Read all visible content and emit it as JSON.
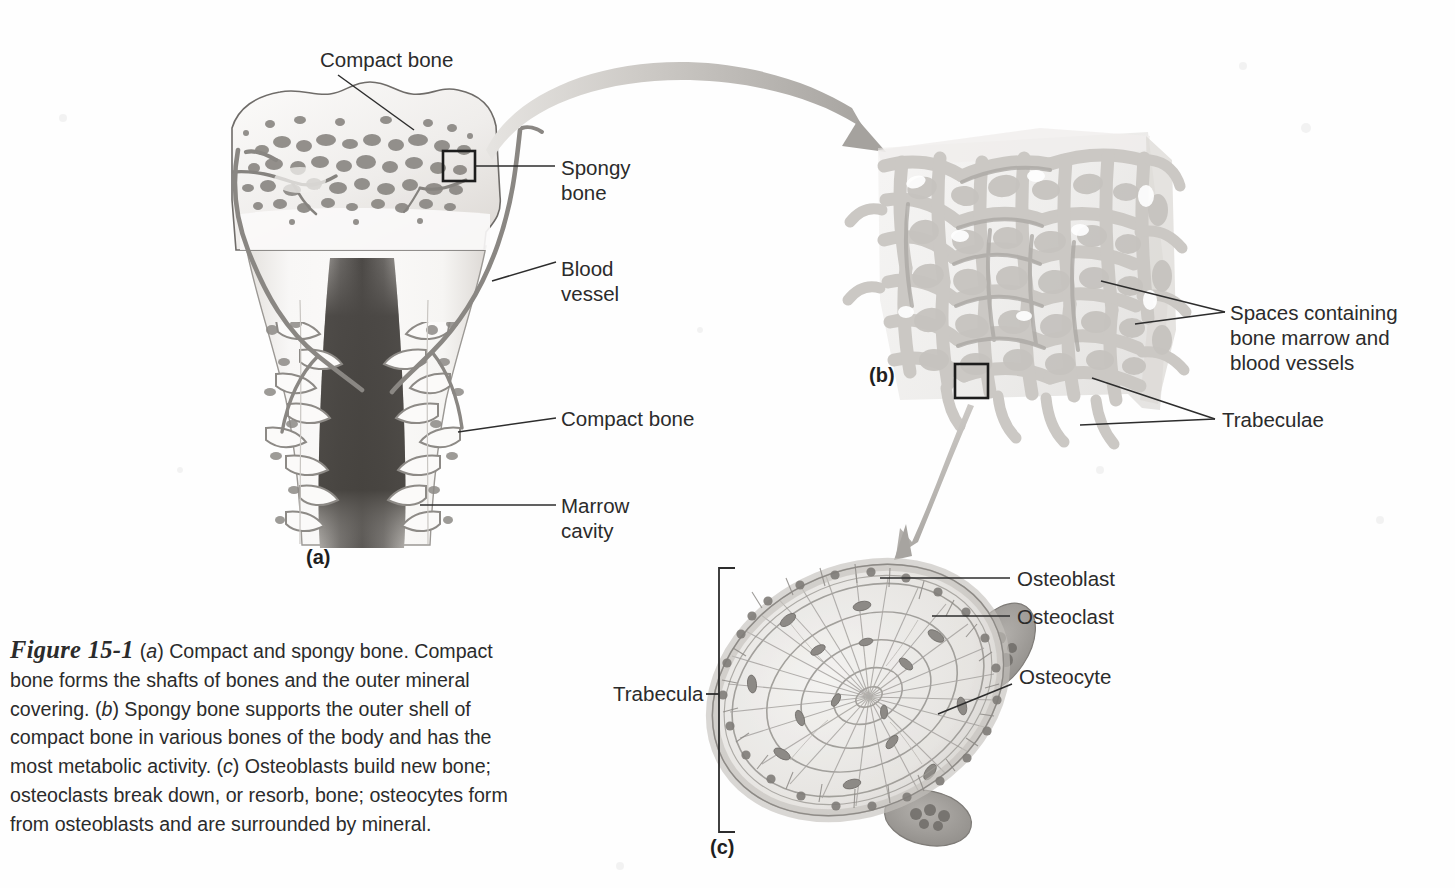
{
  "figure": {
    "number": "Figure 15-1",
    "caption_parts": [
      "(",
      "a",
      ") Compact and spongy bone. Compact bone forms the shafts of bones and the outer mineral covering. (",
      "b",
      ") Spongy bone supports the outer shell of compact bone in various bones of the body and has the most metabolic activity. (",
      "c",
      ") Osteoblasts build new bone; osteoclasts break down, or resorb, bone; osteocytes form from osteoblasts and are surrounded by mineral."
    ],
    "caption_full": "Figure 15-1 (a) Compact and spongy bone. Compact bone forms the shafts of bones and the outer mineral covering. (b) Spongy bone supports the outer shell of compact bone in various bones of the body and has the most metabolic activity. (c) Osteoblasts build new bone; osteoclasts break down, or resorb, bone; osteocytes form from osteoblasts and are surrounded by mineral."
  },
  "panels": {
    "a": {
      "tag": "(a)",
      "title": "Long bone section"
    },
    "b": {
      "tag": "(b)",
      "title": "Spongy bone block"
    },
    "c": {
      "tag": "(c)",
      "title": "Trabecula cross-section"
    }
  },
  "labels": {
    "compact_bone_top": "Compact bone",
    "spongy_bone": "Spongy\nbone",
    "blood_vessel": "Blood\nvessel",
    "compact_bone_shaft": "Compact bone",
    "marrow_cavity": "Marrow\ncavity",
    "spaces": "Spaces containing\nbone marrow and\nblood vessels",
    "trabeculae": "Trabeculae",
    "trabecula": "Trabecula",
    "osteoblast": "Osteoblast",
    "osteoclast": "Osteoclast",
    "osteocyte": "Osteocyte"
  },
  "colors": {
    "background": "#fefefe",
    "text": "#2b2b2b",
    "leader_line": "#2d2d2d",
    "bone_light": "#f2f0ee",
    "bone_mid": "#d8d5d1",
    "bone_shade": "#b6b2ad",
    "trabecula_dark": "#8d8a86",
    "marrow_dark": "#4a4744",
    "vessel": "#8a8783",
    "arrow_light": "#cfcdc9",
    "arrow_dark": "#a9a6a2",
    "osteoclast": "#9b9894"
  }
}
